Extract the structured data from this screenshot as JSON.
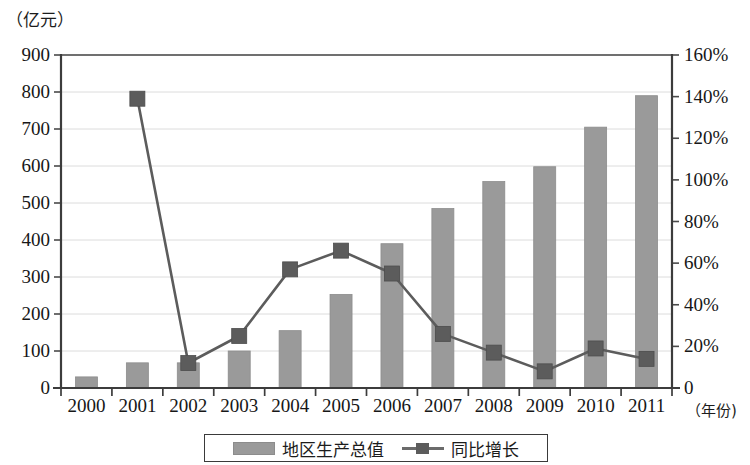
{
  "chart_data": {
    "type": "bar",
    "title": "",
    "subtitle": "",
    "categories": [
      "2000",
      "2001",
      "2002",
      "2003",
      "2004",
      "2005",
      "2006",
      "2007",
      "2008",
      "2009",
      "2010",
      "2011"
    ],
    "xlabel": "（年份)",
    "ylabel_left": "（亿元）",
    "ylabel_right": "",
    "ylim_left": [
      0,
      900
    ],
    "ylim_right": [
      0,
      160
    ],
    "ytick_left": [
      "0",
      "100",
      "200",
      "300",
      "400",
      "500",
      "600",
      "700",
      "800",
      "900"
    ],
    "ytick_right": [
      "0",
      "20%",
      "40%",
      "60%",
      "80%",
      "100%",
      "120%",
      "140%",
      "160%"
    ],
    "grid": true,
    "legend_position": "bottom",
    "series": [
      {
        "name": "地区生产总值",
        "kind": "bar",
        "axis": "left",
        "color": "#9a9a9a",
        "values": [
          30,
          68,
          68,
          100,
          155,
          253,
          390,
          485,
          558,
          598,
          705,
          790
        ]
      },
      {
        "name": "同比增长",
        "kind": "line",
        "axis": "right",
        "color": "#5c5c5c",
        "marker": "square",
        "values": [
          null,
          139,
          12,
          25,
          57,
          66,
          55,
          26,
          17,
          8,
          19,
          14
        ]
      }
    ]
  },
  "legend": {
    "entries": [
      {
        "label": "地区生产总值",
        "swatch": "bar-swatch"
      },
      {
        "label": "同比增长",
        "swatch": "line-marker-swatch"
      }
    ]
  }
}
